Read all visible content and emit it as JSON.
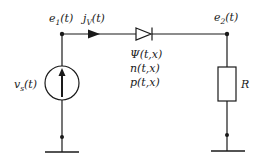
{
  "diagram": {
    "type": "circuit-schematic",
    "colors": {
      "stroke": "#1a1a1a",
      "background": "#ffffff"
    },
    "nodes": {
      "e1": {
        "label": "e",
        "sub": "1",
        "arg": "(t)"
      },
      "e2": {
        "label": "e",
        "sub": "2",
        "arg": "(t)"
      }
    },
    "current": {
      "label": "j",
      "sub": "V",
      "arg": "(t)"
    },
    "source": {
      "label": "v",
      "sub": "s",
      "arg": "(t)",
      "kind": "current-source",
      "direction": "up"
    },
    "diode": {
      "kind": "diode",
      "variables": [
        "Ψ(t,x)",
        "n(t,x)",
        "p(t,x)"
      ]
    },
    "resistor": {
      "label": "R",
      "kind": "resistor"
    },
    "grounds": [
      "ground-left",
      "ground-right"
    ]
  }
}
